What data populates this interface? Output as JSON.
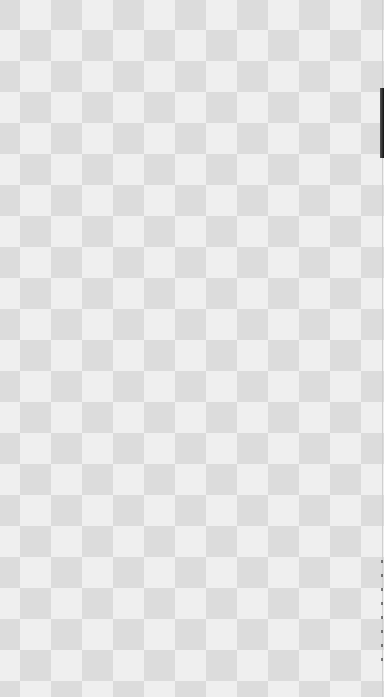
{
  "canvas": {
    "description": "transparency checkerboard",
    "square_size_px": 31,
    "colors": {
      "light": "#efefef",
      "dark": "#dcdcdc",
      "edge": "#111111"
    }
  }
}
